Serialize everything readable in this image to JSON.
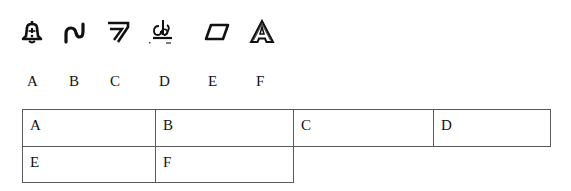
{
  "icons": [
    {
      "name": "warning-bell-icon",
      "label": "bell with exclamation"
    },
    {
      "name": "wave-curve-icon",
      "label": "wavy curve"
    },
    {
      "name": "double-chevron-icon",
      "label": "double angled stroke"
    },
    {
      "name": "glyph-symbol-icon",
      "label": "composite glyph on baseline"
    },
    {
      "name": "parallelogram-icon",
      "label": "parallelogram outline"
    },
    {
      "name": "outlined-a-icon",
      "label": "outlined letter A"
    }
  ],
  "letters": [
    "A",
    "B",
    "C",
    "D",
    "E",
    "F"
  ],
  "table": {
    "rows": [
      [
        "A",
        "B",
        "C",
        "D"
      ],
      [
        "E",
        "F"
      ]
    ]
  },
  "colors": {
    "border": "#5a5a5a",
    "text": "#111111",
    "background": "#ffffff"
  }
}
